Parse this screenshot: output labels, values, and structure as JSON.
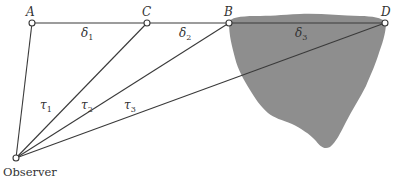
{
  "diagram": {
    "points": [
      {
        "id": "A",
        "label": "A"
      },
      {
        "id": "C",
        "label": "C"
      },
      {
        "id": "B",
        "label": "B"
      },
      {
        "id": "D",
        "label": "D"
      },
      {
        "id": "O",
        "label": "Observer"
      }
    ],
    "horizontal_segments": [
      {
        "from": "A",
        "to": "C",
        "symbol": "δ",
        "subscript": "1"
      },
      {
        "from": "C",
        "to": "B",
        "symbol": "δ",
        "subscript": "2"
      },
      {
        "from": "B",
        "to": "D",
        "symbol": "δ",
        "subscript": "3"
      }
    ],
    "sight_lines": [
      {
        "from": "O",
        "to": "A"
      },
      {
        "from": "O",
        "to": "C"
      },
      {
        "from": "O",
        "to": "B"
      },
      {
        "from": "O",
        "to": "D"
      }
    ],
    "time_labels": [
      {
        "symbol": "τ",
        "subscript": "1"
      },
      {
        "symbol": "τ",
        "subscript": "2"
      },
      {
        "symbol": "τ",
        "subscript": "3"
      }
    ],
    "region": {
      "description": "gray irregular obstruction",
      "color": "#8e8e8e"
    }
  }
}
